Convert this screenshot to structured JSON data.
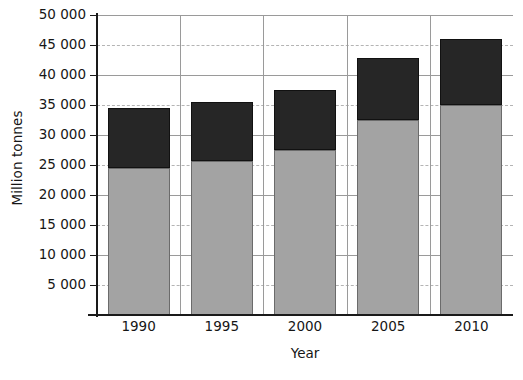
{
  "chart_data": {
    "type": "bar",
    "stacked": true,
    "title": "",
    "xlabel": "Year",
    "ylabel": "Million tonnes",
    "categories": [
      "1990",
      "1995",
      "2000",
      "2005",
      "2010"
    ],
    "series": [
      {
        "name": "lower-segment",
        "color": "#a3a3a3",
        "values": [
          24500,
          25700,
          27500,
          32500,
          35000
        ]
      },
      {
        "name": "upper-segment",
        "color": "#262626",
        "values": [
          10000,
          9800,
          10000,
          10300,
          11000
        ]
      }
    ],
    "totals": [
      34500,
      35500,
      37500,
      42800,
      46000
    ],
    "ylim": [
      0,
      50000
    ],
    "ytick_values": [
      5000,
      10000,
      15000,
      20000,
      25000,
      30000,
      35000,
      40000,
      45000,
      50000
    ],
    "ytick_labels": [
      "5 000",
      "10 000",
      "15 000",
      "20 000",
      "25 000",
      "30 000",
      "35 000",
      "40 000",
      "45 000",
      "50 000"
    ],
    "grid": {
      "horizontal": true,
      "vertical": true,
      "solid_at": [
        10000,
        20000,
        30000,
        40000,
        50000
      ],
      "dashed_at": [
        5000,
        15000,
        25000,
        35000,
        45000
      ],
      "solid_color": "#9a9a9a",
      "dashed_color": "#b4b4b4"
    },
    "legend": null,
    "legend_position": "none"
  }
}
